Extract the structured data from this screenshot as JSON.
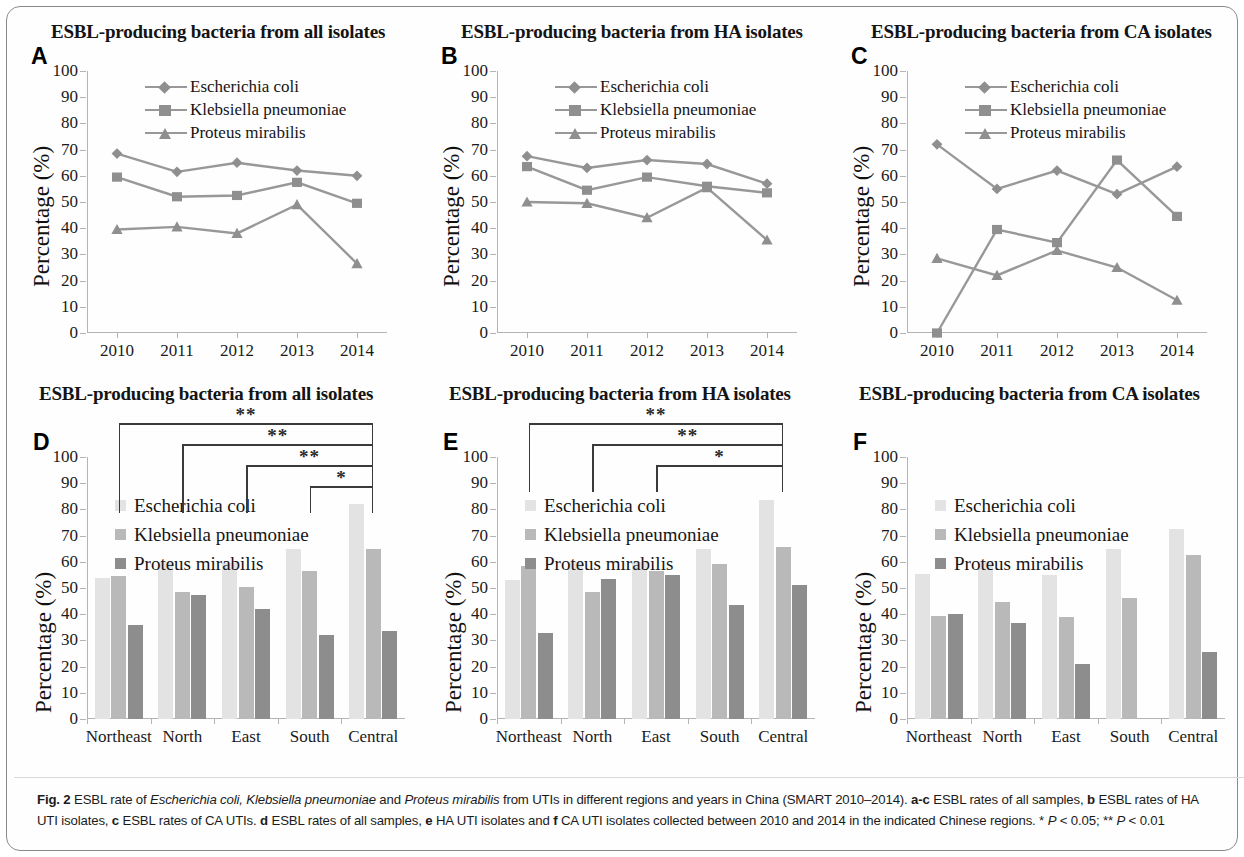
{
  "figure": {
    "label": "Fig. 2",
    "caption_parts": [
      {
        "t": "Fig. 2 ",
        "b": true
      },
      {
        "t": "ESBL rate of "
      },
      {
        "t": "Escherichia coli, Klebsiella pneumoniae",
        "i": true
      },
      {
        "t": " and "
      },
      {
        "t": "Proteus mirabilis",
        "i": true
      },
      {
        "t": " from UTIs in different regions and years in China (SMART 2010–2014). "
      },
      {
        "t": "a-c",
        "b": true
      },
      {
        "t": " ESBL rates of all samples, "
      },
      {
        "t": "b",
        "b": true
      },
      {
        "t": " ESBL rates of HA UTI isolates, "
      },
      {
        "t": "c",
        "b": true
      },
      {
        "t": " ESBL rates of CA UTIs. "
      },
      {
        "t": "d",
        "b": true
      },
      {
        "t": " ESBL rates of all samples, "
      },
      {
        "t": "e",
        "b": true
      },
      {
        "t": " HA UTI isolates and "
      },
      {
        "t": "f",
        "b": true
      },
      {
        "t": " CA UTI isolates collected between 2010 and 2014 in the indicated Chinese regions. * "
      },
      {
        "t": "P",
        "i": true
      },
      {
        "t": " < 0.05; ** "
      },
      {
        "t": "P",
        "i": true
      },
      {
        "t": " < 0.01"
      }
    ],
    "caption_plain": "Fig. 2 ESBL rate of Escherichia coli, Klebsiella pneumoniae and Proteus mirabilis from UTIs in different regions and years in China (SMART 2010–2014). a-c ESBL rates of all samples, b ESBL rates of HA UTI isolates, c ESBL rates of CA UTIs. d ESBL rates of all samples, e HA UTI isolates and f CA UTI isolates collected between 2010 and 2014 in the indicated Chinese regions. * P < 0.05; ** P < 0.01"
  },
  "axis": {
    "ylabel": "Percentage (%)",
    "yticks": [
      "100",
      "90",
      "80",
      "70",
      "60",
      "50",
      "40",
      "30",
      "20",
      "10",
      "0"
    ],
    "ylim": [
      0,
      100
    ],
    "years": [
      "2010",
      "2011",
      "2012",
      "2013",
      "2014"
    ],
    "regions": [
      "Northeast",
      "North",
      "East",
      "South",
      "Central"
    ]
  },
  "series_names": {
    "ecoli": "Escherichia coli",
    "kpneu": "Klebsiella pneumoniae",
    "pmira": "Proteus mirabilis"
  },
  "colors": {
    "line": "#989898",
    "marker": "#8f8f8f",
    "bar_ecoli": "#e3e3e3",
    "bar_kpneu": "#b9b9b9",
    "bar_pmira": "#8d8d8d",
    "axis": "#b4b4b4",
    "bracket": "#3a3a3a",
    "frame": "#8a8a8a"
  },
  "significance": {
    "one_star": "*",
    "two_star": "**",
    "p_one": "P < 0.05",
    "p_two": "P < 0.01"
  },
  "panels": [
    {
      "id": "A",
      "letter": "A",
      "title": "ESBL-producing bacteria from all isolates"
    },
    {
      "id": "B",
      "letter": "B",
      "title": "ESBL-producing bacteria from HA isolates"
    },
    {
      "id": "C",
      "letter": "C",
      "title": "ESBL-producing bacteria from CA isolates"
    },
    {
      "id": "D",
      "letter": "D",
      "title": "ESBL-producing bacteria from all isolates"
    },
    {
      "id": "E",
      "letter": "E",
      "title": "ESBL-producing bacteria from HA isolates"
    },
    {
      "id": "F",
      "letter": "F",
      "title": "ESBL-producing bacteria from CA isolates"
    }
  ],
  "chart_data": [
    {
      "panel": "A",
      "type": "line",
      "title": "ESBL-producing bacteria from all isolates",
      "xlabel": "",
      "ylabel": "Percentage (%)",
      "ylim": [
        0,
        100
      ],
      "grid": false,
      "legend_position": "top-center",
      "x": [
        "2010",
        "2011",
        "2012",
        "2013",
        "2014"
      ],
      "series": [
        {
          "name": "Escherichia coli",
          "marker": "diamond",
          "values": [
            68.5,
            61.5,
            65,
            62,
            60
          ]
        },
        {
          "name": "Klebsiella pneumoniae",
          "marker": "square",
          "values": [
            59.5,
            52,
            52.5,
            57.5,
            49.5
          ]
        },
        {
          "name": "Proteus mirabilis",
          "marker": "triangle",
          "values": [
            39.5,
            40.5,
            38,
            49,
            26.5
          ]
        }
      ]
    },
    {
      "panel": "B",
      "type": "line",
      "title": "ESBL-producing bacteria from HA isolates",
      "xlabel": "",
      "ylabel": "Percentage (%)",
      "ylim": [
        0,
        100
      ],
      "grid": false,
      "legend_position": "top-center",
      "x": [
        "2010",
        "2011",
        "2012",
        "2013",
        "2014"
      ],
      "series": [
        {
          "name": "Escherichia coli",
          "marker": "diamond",
          "values": [
            67.5,
            63,
            66,
            64.5,
            57
          ]
        },
        {
          "name": "Klebsiella pneumoniae",
          "marker": "square",
          "values": [
            63.5,
            54.5,
            59.5,
            56,
            53.5
          ]
        },
        {
          "name": "Proteus mirabilis",
          "marker": "triangle",
          "values": [
            50,
            49.5,
            44,
            55.5,
            35.5
          ]
        }
      ]
    },
    {
      "panel": "C",
      "type": "line",
      "title": "ESBL-producing bacteria from CA isolates",
      "xlabel": "",
      "ylabel": "Percentage (%)",
      "ylim": [
        0,
        100
      ],
      "grid": false,
      "legend_position": "top-center",
      "x": [
        "2010",
        "2011",
        "2012",
        "2013",
        "2014"
      ],
      "series": [
        {
          "name": "Escherichia coli",
          "marker": "diamond",
          "values": [
            72,
            55,
            62,
            53,
            63.5
          ]
        },
        {
          "name": "Klebsiella pneumoniae",
          "marker": "square",
          "values": [
            0,
            39.5,
            34.5,
            66,
            44.5
          ]
        },
        {
          "name": "Proteus mirabilis",
          "marker": "triangle",
          "values": [
            28.5,
            22,
            31.5,
            25,
            12.5
          ]
        }
      ]
    },
    {
      "panel": "D",
      "type": "bar",
      "title": "ESBL-producing bacteria from all isolates",
      "xlabel": "",
      "ylabel": "Percentage (%)",
      "ylim": [
        0,
        100
      ],
      "grid": false,
      "legend_position": "upper-left",
      "categories": [
        "Northeast",
        "North",
        "East",
        "South",
        "Central"
      ],
      "series": [
        {
          "name": "Escherichia coli",
          "values": [
            54,
            60,
            59.5,
            65,
            82
          ]
        },
        {
          "name": "Klebsiella pneumoniae",
          "values": [
            54.5,
            48.5,
            50.5,
            56.5,
            65
          ]
        },
        {
          "name": "Proteus mirabilis",
          "values": [
            36,
            47.5,
            42,
            32,
            33.5
          ]
        }
      ],
      "annotations": [
        {
          "from": "Northeast",
          "to": "Central",
          "label": "**"
        },
        {
          "from": "North",
          "to": "Central",
          "label": "**"
        },
        {
          "from": "East",
          "to": "Central",
          "label": "**"
        },
        {
          "from": "South",
          "to": "Central",
          "label": "*"
        }
      ]
    },
    {
      "panel": "E",
      "type": "bar",
      "title": "ESBL-producing bacteria from HA isolates",
      "xlabel": "",
      "ylabel": "Percentage (%)",
      "ylim": [
        0,
        100
      ],
      "grid": false,
      "legend_position": "upper-left",
      "categories": [
        "Northeast",
        "North",
        "East",
        "South",
        "Central"
      ],
      "series": [
        {
          "name": "Escherichia coli",
          "values": [
            53,
            60,
            60,
            65,
            83.5
          ]
        },
        {
          "name": "Klebsiella pneumoniae",
          "values": [
            58.5,
            48.5,
            56.5,
            59,
            65.5
          ]
        },
        {
          "name": "Proteus mirabilis",
          "values": [
            33,
            53.5,
            55,
            43.5,
            51
          ]
        }
      ],
      "annotations": [
        {
          "from": "Northeast",
          "to": "Central",
          "label": "**"
        },
        {
          "from": "North",
          "to": "Central",
          "label": "**"
        },
        {
          "from": "East",
          "to": "Central",
          "label": "*"
        }
      ]
    },
    {
      "panel": "F",
      "type": "bar",
      "title": "ESBL-producing bacteria from CA isolates",
      "xlabel": "",
      "ylabel": "Percentage (%)",
      "ylim": [
        0,
        100
      ],
      "grid": false,
      "legend_position": "upper-left",
      "categories": [
        "Northeast",
        "North",
        "East",
        "South",
        "Central"
      ],
      "series": [
        {
          "name": "Escherichia coli",
          "values": [
            55.5,
            60.5,
            55,
            65,
            72.5
          ]
        },
        {
          "name": "Klebsiella pneumoniae",
          "values": [
            39.5,
            44.5,
            39,
            46,
            62.5
          ]
        },
        {
          "name": "Proteus mirabilis",
          "values": [
            40,
            36.5,
            21,
            null,
            25.5
          ]
        }
      ],
      "annotations": []
    }
  ]
}
